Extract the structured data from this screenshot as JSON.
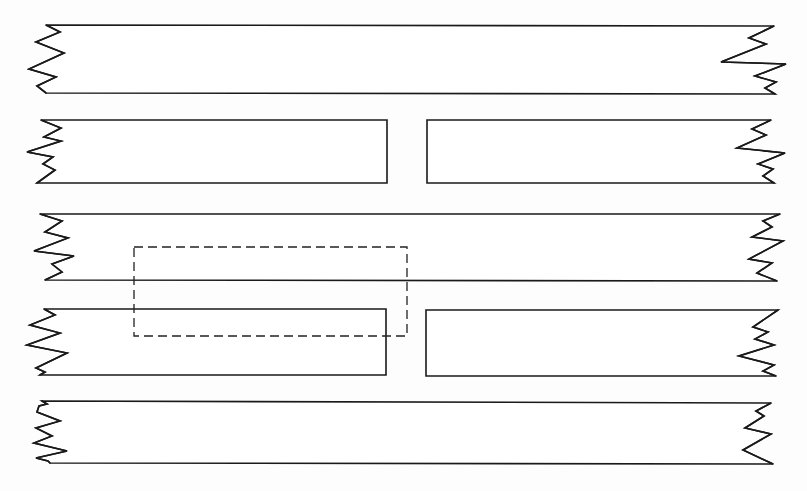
{
  "diagram": {
    "type": "line-drawing",
    "colors": {
      "background": "#ffffff",
      "stroke": "#1a1a1a",
      "dashed_stroke": "#222222"
    },
    "strips": [
      {
        "id": "strip-1",
        "label": "",
        "top": 25,
        "bottom": 93,
        "left_break": [
          [
            46,
            25
          ],
          [
            60,
            32
          ],
          [
            36,
            42
          ],
          [
            64,
            53
          ],
          [
            29,
            69
          ],
          [
            56,
            77
          ],
          [
            37,
            86
          ],
          [
            46,
            93
          ]
        ],
        "right_break": [
          [
            774,
            26
          ],
          [
            749,
            38
          ],
          [
            766,
            44
          ],
          [
            721,
            62
          ],
          [
            786,
            64
          ],
          [
            755,
            76
          ],
          [
            776,
            82
          ],
          [
            765,
            88
          ],
          [
            775,
            94
          ]
        ],
        "split": false
      },
      {
        "id": "strip-2",
        "label": "",
        "top": 120,
        "bottom": 183,
        "left_break": [
          [
            41,
            120
          ],
          [
            61,
            128
          ],
          [
            44,
            137
          ],
          [
            61,
            141
          ],
          [
            27,
            152
          ],
          [
            53,
            157
          ],
          [
            43,
            164
          ],
          [
            55,
            170
          ],
          [
            37,
            183
          ]
        ],
        "right_break": [
          [
            771,
            120
          ],
          [
            752,
            129
          ],
          [
            766,
            135
          ],
          [
            737,
            148
          ],
          [
            785,
            153
          ],
          [
            758,
            164
          ],
          [
            773,
            169
          ],
          [
            763,
            176
          ],
          [
            774,
            183
          ]
        ],
        "split": true,
        "gap_left_x": 387,
        "gap_right_x": 427
      },
      {
        "id": "strip-3",
        "label": "",
        "top": 214,
        "bottom": 280,
        "left_break": [
          [
            40,
            214
          ],
          [
            62,
            221
          ],
          [
            45,
            232
          ],
          [
            68,
            238
          ],
          [
            34,
            251
          ],
          [
            74,
            256
          ],
          [
            52,
            264
          ],
          [
            62,
            272
          ],
          [
            45,
            280
          ]
        ],
        "right_break": [
          [
            780,
            214
          ],
          [
            763,
            221
          ],
          [
            772,
            227
          ],
          [
            752,
            237
          ],
          [
            783,
            241
          ],
          [
            749,
            259
          ],
          [
            772,
            263
          ],
          [
            757,
            273
          ],
          [
            777,
            281
          ]
        ],
        "split": false
      },
      {
        "id": "strip-4",
        "label": "",
        "top": 309,
        "bottom": 375,
        "left_break": [
          [
            44,
            309
          ],
          [
            55,
            315
          ],
          [
            30,
            325
          ],
          [
            60,
            333
          ],
          [
            27,
            345
          ],
          [
            67,
            353
          ],
          [
            36,
            368
          ],
          [
            45,
            372
          ],
          [
            40,
            375
          ]
        ],
        "right_break": [
          [
            778,
            310
          ],
          [
            753,
            327
          ],
          [
            768,
            332
          ],
          [
            755,
            339
          ],
          [
            774,
            345
          ],
          [
            739,
            356
          ],
          [
            774,
            365
          ],
          [
            763,
            371
          ],
          [
            776,
            376
          ]
        ],
        "split": true,
        "gap_left_x": 386,
        "gap_right_x": 426
      },
      {
        "id": "strip-5",
        "label": "",
        "top": 401,
        "bottom": 463,
        "left_break": [
          [
            42,
            401
          ],
          [
            47,
            404
          ],
          [
            39,
            406
          ],
          [
            37,
            412
          ],
          [
            60,
            421
          ],
          [
            36,
            428
          ],
          [
            52,
            436
          ],
          [
            34,
            443
          ],
          [
            67,
            451
          ],
          [
            36,
            458
          ],
          [
            48,
            461
          ],
          [
            50,
            463
          ]
        ],
        "right_break": [
          [
            771,
            403
          ],
          [
            756,
            411
          ],
          [
            764,
            416
          ],
          [
            745,
            428
          ],
          [
            771,
            434
          ],
          [
            743,
            450
          ],
          [
            773,
            464
          ]
        ],
        "split": false
      }
    ],
    "dashed_region": {
      "id": "dashed-overlap-region",
      "x": 134,
      "y": 247,
      "width": 273,
      "height": 89
    }
  }
}
